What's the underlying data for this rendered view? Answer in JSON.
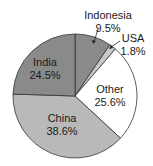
{
  "chart_data": {
    "type": "pie",
    "title": "",
    "categories": [
      "Indonesia",
      "USA",
      "Other",
      "China",
      "India"
    ],
    "values": [
      9.5,
      1.8,
      25.6,
      38.6,
      24.5
    ],
    "labels": [
      "9.5%",
      "1.8%",
      "25.6%",
      "38.6%",
      "24.5%"
    ],
    "colors": [
      "#8a8a8a",
      "#c8c8c8",
      "#ffffff",
      "#b9b9b9",
      "#8a8a8a"
    ],
    "start_angle": "12 o'clock",
    "direction": "clockwise",
    "legend": "none (labels on/near slices)"
  },
  "slices": {
    "indonesia": {
      "name": "Indonesia",
      "pct": "9.5%"
    },
    "usa": {
      "name": "USA",
      "pct": "1.8%"
    },
    "other": {
      "name": "Other",
      "pct": "25.6%"
    },
    "china": {
      "name": "China",
      "pct": "38.6%"
    },
    "india": {
      "name": "India",
      "pct": "24.5%"
    }
  }
}
